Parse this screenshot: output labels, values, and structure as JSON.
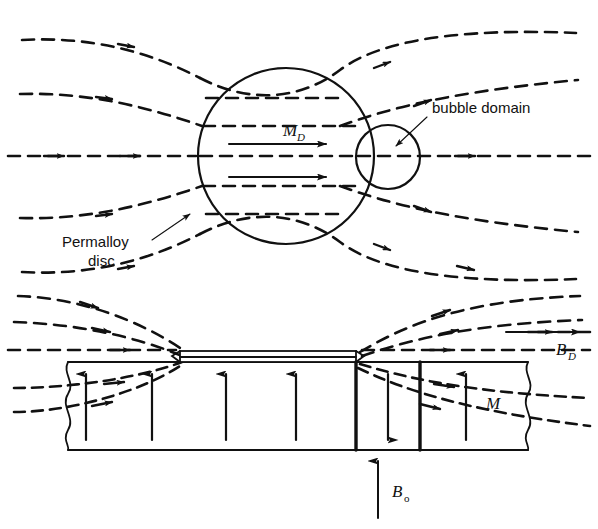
{
  "figure": {
    "background_color": "#ffffff",
    "line_color": "#111111",
    "width": 598,
    "height": 529
  },
  "labels": {
    "bubble_domain": "bubble domain",
    "permalloy_line1": "Permalloy",
    "permalloy_line2": "disc",
    "m_d_symbol": "M",
    "m_d_subscript": "D",
    "b_d_symbol": "B",
    "b_d_subscript": "D",
    "b_0_symbol": "B",
    "b_0_subscript": "o",
    "m_symbol": "M"
  },
  "panels": {
    "top": {
      "name": "plan-view",
      "disc": {
        "cx": 286,
        "cy": 156,
        "r": 88
      },
      "bubble": {
        "cx": 388,
        "cy": 157,
        "r": 32
      },
      "field_line_count": 7,
      "magnetization_arrow_count": 2
    },
    "bottom": {
      "name": "cross-section-view",
      "film_slab": {
        "x": 68,
        "y": 362,
        "width": 460,
        "height": 88
      },
      "permalloy_layer": {
        "x": 180,
        "y": 351,
        "width": 176,
        "height": 11
      },
      "domain_wall_x": [
        356,
        420
      ],
      "magnetization_up_count": 6,
      "magnetization_down_count": 1,
      "field_line_count": 6
    }
  }
}
